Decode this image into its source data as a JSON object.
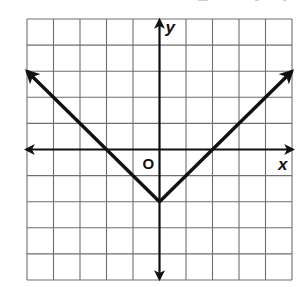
{
  "chart_data": {
    "type": "line",
    "title": "",
    "function": "y = |x| - 2",
    "xlabel": "x",
    "ylabel": "y",
    "origin_label": "O",
    "xlim": [
      -5,
      5
    ],
    "ylim": [
      -5,
      5
    ],
    "grid": true,
    "grid_step": 1,
    "tick_labels": false,
    "series": [
      {
        "name": "y = |x| - 2",
        "points": [
          [
            -5,
            3
          ],
          [
            -2,
            0
          ],
          [
            0,
            -2
          ],
          [
            2,
            0
          ],
          [
            5,
            3
          ]
        ],
        "vertex": [
          0,
          -2
        ],
        "x_intercepts": [
          -2,
          2
        ],
        "y_intercept": -2,
        "arrows_at_ends": true
      }
    ],
    "axes_arrows": true
  },
  "labels": {
    "x_axis": "x",
    "y_axis": "y",
    "origin": "O"
  },
  "colors": {
    "grid": "#6e6e6e",
    "axes": "#111111",
    "graph": "#111111",
    "background": "#ffffff"
  }
}
